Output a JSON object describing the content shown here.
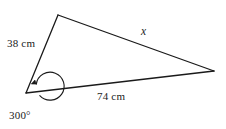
{
  "diagram": {
    "type": "geometry-triangle-with-reflex-angle",
    "background_color": "#ffffff",
    "stroke_color": "#1a1a1a",
    "text_color": "#1a1a1a",
    "labels": {
      "side_a": "38 cm",
      "side_b": "74 cm",
      "side_x": "x",
      "angle": "300°"
    },
    "geometry": {
      "vertices": {
        "top": {
          "x": 58,
          "y": 15
        },
        "bottom_left": {
          "x": 26,
          "y": 93
        },
        "right": {
          "x": 214,
          "y": 71
        }
      },
      "angle_arc": {
        "center": {
          "x": 26,
          "y": 93
        },
        "radius": 14,
        "sweep_degrees": 300,
        "arrowhead": true
      }
    },
    "measurements": {
      "side_38_cm_value": 38,
      "side_38_cm_unit": "cm",
      "side_74_cm_value": 74,
      "side_74_cm_unit": "cm",
      "unknown_side_symbol": "x",
      "reflex_angle_degrees": 300
    }
  }
}
